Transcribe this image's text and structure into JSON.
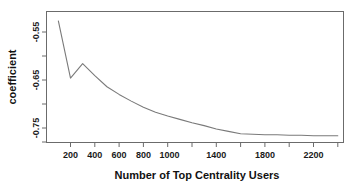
{
  "chart_data": {
    "type": "line",
    "title": "",
    "xlabel": "Number of Top Centrality Users",
    "ylabel": "coefficient",
    "xlim": [
      60,
      2500
    ],
    "ylim": [
      -0.782,
      -0.518
    ],
    "grid": false,
    "legend": null,
    "x_ticks": [
      200,
      400,
      600,
      800,
      1000,
      1200,
      1400,
      1600,
      1800,
      2000,
      2200,
      2400
    ],
    "x_tick_labels": [
      "200",
      "400",
      "600",
      "800",
      "1000",
      "",
      "1400",
      "",
      "1800",
      "",
      "2200",
      ""
    ],
    "y_ticks": [
      -0.55,
      -0.6,
      -0.65,
      -0.7,
      -0.75,
      -0.78
    ],
    "y_tick_labels": [
      "-0.55",
      "",
      "-0.65",
      "",
      "-0.75",
      ""
    ],
    "series": [
      {
        "name": "coefficient",
        "color": "#7a7a7a",
        "x": [
          100,
          200,
          300,
          400,
          500,
          600,
          700,
          800,
          900,
          1000,
          1100,
          1200,
          1300,
          1400,
          1500,
          1600,
          1700,
          1800,
          1900,
          2000,
          2100,
          2200,
          2300,
          2400
        ],
        "y": [
          -0.527,
          -0.646,
          -0.616,
          -0.641,
          -0.664,
          -0.68,
          -0.694,
          -0.707,
          -0.717,
          -0.725,
          -0.732,
          -0.739,
          -0.745,
          -0.752,
          -0.757,
          -0.762,
          -0.763,
          -0.764,
          -0.764,
          -0.765,
          -0.765,
          -0.766,
          -0.766,
          -0.766
        ]
      }
    ]
  },
  "axis": {
    "y_label": "coefficient",
    "x_label": "Number of Top Centrality Users",
    "y_tick_0": "-0.55",
    "y_tick_1": "-0.65",
    "y_tick_2": "-0.75",
    "x_tick_0": "200",
    "x_tick_1": "400",
    "x_tick_2": "600",
    "x_tick_3": "800",
    "x_tick_4": "1000",
    "x_tick_5": "1400",
    "x_tick_6": "1800",
    "x_tick_7": "2200"
  }
}
